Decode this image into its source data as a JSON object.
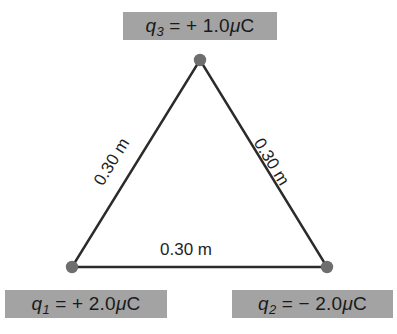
{
  "figure": {
    "background_color": "#ffffff",
    "line_color": "#2b2b2b",
    "vertex_dot_color": "#6e6e6e",
    "label_background_color": "#a3a3a3",
    "label_text_color": "#1a1a1a"
  },
  "charges": {
    "q3": {
      "symbol": "q",
      "subscript": "3",
      "equals": " = ",
      "value": "+ 1.0",
      "unit_mu": "μ",
      "unit_c": "C",
      "full_text": "q3 = + 1.0μC"
    },
    "q1": {
      "symbol": "q",
      "subscript": "1",
      "equals": " = ",
      "value": "+ 2.0",
      "unit_mu": "μ",
      "unit_c": "C",
      "full_text": "q1 = + 2.0μC"
    },
    "q2": {
      "symbol": "q",
      "subscript": "2",
      "equals": " = ",
      "value": "− 2.0",
      "unit_mu": "μ",
      "unit_c": "C",
      "full_text": "q2 = − 2.0μC"
    }
  },
  "distances": {
    "left_side": "0.30 m",
    "right_side": "0.30 m",
    "bottom_side": "0.30 m"
  },
  "geometry": {
    "apex": {
      "x": 200,
      "y": 60
    },
    "bottom_left": {
      "x": 72,
      "y": 267
    },
    "bottom_right": {
      "x": 327,
      "y": 267
    },
    "dot_radius": 6,
    "line_width": 2.4
  }
}
